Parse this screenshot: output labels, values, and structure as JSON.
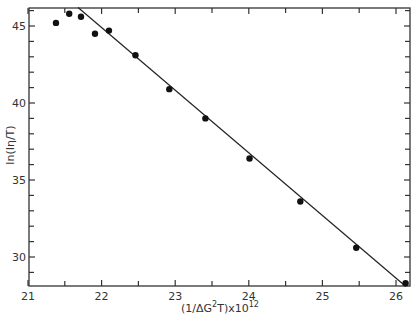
{
  "chart_data": {
    "type": "scatter",
    "title": "",
    "xlabel": "(1/ΔG²T)x10¹²",
    "xlabel_parts": {
      "pre": "(1/ΔG",
      "sup1": "2",
      "mid": "T)x10",
      "sup2": "12"
    },
    "ylabel": "ln(Iη/T)",
    "xlim": [
      21,
      26.2
    ],
    "ylim": [
      28.05,
      46.2
    ],
    "xticks": [
      21,
      22,
      23,
      24,
      25,
      26
    ],
    "xtick_labels": [
      "21",
      "22",
      "23",
      "24",
      "25",
      "26"
    ],
    "yticks": [
      30,
      35,
      40,
      45
    ],
    "ytick_labels": [
      "30",
      "35",
      "40",
      "45"
    ],
    "grid": false,
    "legend": null,
    "series": [
      {
        "name": "data",
        "x": [
          21.38,
          21.56,
          21.72,
          21.91,
          22.1,
          22.46,
          22.92,
          23.41,
          24.01,
          24.7,
          25.46,
          26.13
        ],
        "y": [
          45.2,
          45.8,
          45.6,
          44.5,
          44.7,
          43.1,
          40.9,
          39.0,
          36.4,
          33.6,
          30.6,
          28.3
        ]
      }
    ],
    "fit_line": {
      "x": [
        21.68,
        26.13
      ],
      "y": [
        46.2,
        28.1
      ]
    }
  },
  "colors": {
    "ink": "#222222",
    "background": "#ffffff"
  }
}
